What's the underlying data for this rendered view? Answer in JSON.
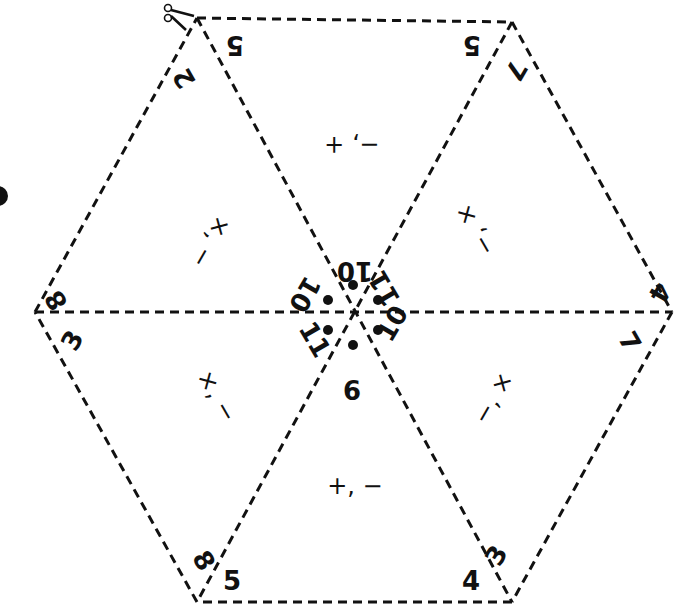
{
  "puzzle": {
    "title": "Hexagon operation puzzle",
    "center_sums": {
      "top": "10",
      "upper_right": "11",
      "lower_right": "10",
      "bottom": "9",
      "lower_left": "11",
      "upper_left": "10"
    },
    "triangles": [
      {
        "position": "top",
        "operators": "−, +",
        "corner_left": "5",
        "corner_right": "5"
      },
      {
        "position": "upper-right",
        "operators": "−, +",
        "corner_top": "7",
        "corner_right": "4"
      },
      {
        "position": "lower-right",
        "operators": "+, −",
        "corner_right": "7",
        "corner_bottom": "3"
      },
      {
        "position": "bottom",
        "operators": "+, −",
        "corner_left": "5",
        "corner_right": "4"
      },
      {
        "position": "lower-left",
        "operators": "+, −",
        "corner_left": "3",
        "corner_bottom": "8"
      },
      {
        "position": "upper-left",
        "operators": "+, −",
        "corner_top": "2",
        "corner_left": "8"
      }
    ],
    "labels": {
      "top_left_5": "5",
      "top_right_5": "5",
      "top_left_2": "2",
      "top_right_7": "7",
      "left_8": "8",
      "left_3": "3",
      "right_4": "4",
      "right_7": "7",
      "bottom_left_8": "8",
      "bottom_left_5": "5",
      "bottom_right_4": "4",
      "bottom_right_3": "3",
      "ops_top": "−, +",
      "ops_upper_left": "×, −",
      "ops_upper_right": "−, ×",
      "ops_lower_left": "×, −",
      "ops_lower_right": "−, ×",
      "ops_bottom": "+, −"
    },
    "icons": {
      "scissors": "scissors-icon"
    },
    "colors": {
      "ink": "#111111",
      "background": "#ffffff"
    }
  }
}
